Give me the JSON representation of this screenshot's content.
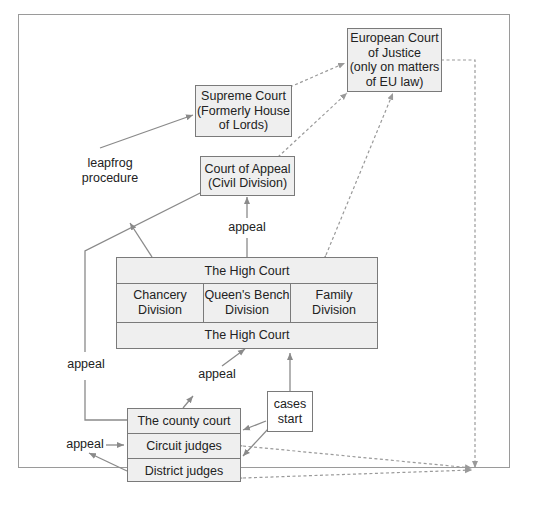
{
  "diagram": {
    "title": "",
    "nodes": {
      "ecj": {
        "lines": [
          "European Court",
          "of Justice",
          "(only on matters",
          "of EU law)"
        ]
      },
      "supreme": {
        "lines": [
          "Supreme Court",
          "(Formerly House",
          "of Lords)"
        ]
      },
      "appeal_court": {
        "lines": [
          "Court of Appeal",
          "(Civil Division)"
        ]
      },
      "high_court": {
        "top": "The High Court",
        "divisions": [
          {
            "lines": [
              "Chancery",
              "Division"
            ]
          },
          {
            "lines": [
              "Queen's Bench",
              "Division"
            ]
          },
          {
            "lines": [
              "Family",
              "Division"
            ]
          }
        ],
        "bottom": "The High Court"
      },
      "county_court": {
        "rows": [
          "The county court",
          "Circuit judges",
          "District judges"
        ]
      },
      "cases_start": {
        "lines": [
          "cases",
          "start"
        ]
      }
    },
    "labels": {
      "leapfrog": [
        "leapfrog",
        "procedure"
      ],
      "appeal_left": "appeal",
      "appeal_mid": "appeal",
      "appeal_lower": "appeal",
      "appeal_county": "appeal"
    },
    "colors": {
      "box_fill": "#efefef",
      "box_border": "#7a7a7a",
      "arrow_solid": "#8a8a8a",
      "arrow_dashed": "#9a9a9a",
      "frame_border": "#9a9a9a"
    }
  }
}
